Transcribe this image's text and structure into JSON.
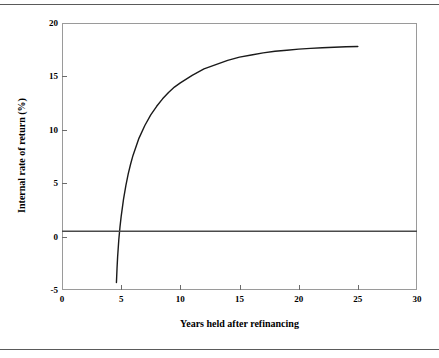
{
  "figure": {
    "rules": {
      "top": true,
      "bottom": true
    },
    "cut_caption": ""
  },
  "chart_data": {
    "type": "line",
    "title": "",
    "xlabel": "Years held after refinancing",
    "ylabel": "Internal rate of return (%)",
    "xlim": [
      0,
      30
    ],
    "ylim": [
      -5,
      20
    ],
    "xticks": [
      0,
      5,
      10,
      15,
      20,
      25,
      30
    ],
    "xtick_labels": [
      "0",
      "5",
      "10",
      "15",
      "20",
      "25",
      "30"
    ],
    "yticks": [
      -5,
      0,
      5,
      10,
      15,
      20
    ],
    "ytick_labels": [
      "-5",
      "0",
      "5",
      "10",
      "15",
      "20"
    ],
    "grid": false,
    "legend": null,
    "series": [
      {
        "name": "Internal rate of return",
        "color": "#1a1a1a",
        "x": [
          4.6,
          4.65,
          4.7,
          4.8,
          4.9,
          5.0,
          5.2,
          5.4,
          5.6,
          5.8,
          6.0,
          6.5,
          7.0,
          7.5,
          8.0,
          8.5,
          9.0,
          9.5,
          10.0,
          11.0,
          12.0,
          13.0,
          14.0,
          15.0,
          16.0,
          17.0,
          18.0,
          19.0,
          20.0,
          21.0,
          22.0,
          23.0,
          24.0,
          25.0
        ],
        "y": [
          -4.3,
          -3.0,
          -1.9,
          -0.3,
          0.9,
          1.9,
          3.5,
          4.8,
          5.9,
          6.8,
          7.6,
          9.2,
          10.4,
          11.4,
          12.2,
          12.9,
          13.5,
          14.0,
          14.4,
          15.1,
          15.7,
          16.1,
          16.5,
          16.8,
          17.0,
          17.2,
          17.35,
          17.45,
          17.55,
          17.62,
          17.68,
          17.73,
          17.77,
          17.8
        ]
      },
      {
        "name": "zero reference line",
        "color": "#4a4a4a",
        "kind": "hline",
        "y_value": 0.5,
        "x_from": 0,
        "x_to": 30
      }
    ]
  }
}
